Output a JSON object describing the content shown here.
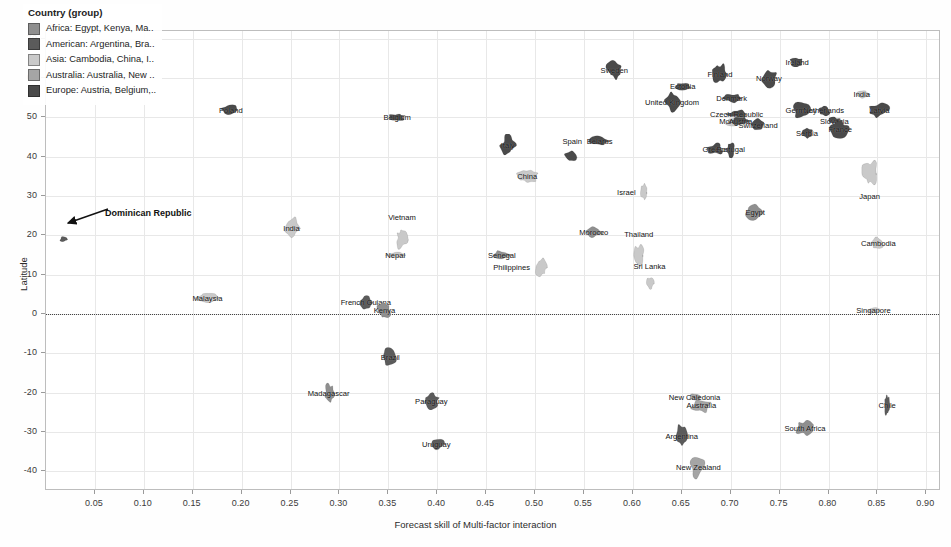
{
  "chart_data": {
    "type": "scatter",
    "title": "",
    "xlabel": "Forecast skill of Multi-factor interaction",
    "ylabel": "Latitude",
    "xlim": [
      0.0,
      0.915
    ],
    "ylim": [
      -45,
      72
    ],
    "xticks": [
      "0.05",
      "0.10",
      "0.15",
      "0.20",
      "0.25",
      "0.30",
      "0.35",
      "0.40",
      "0.45",
      "0.50",
      "0.55",
      "0.60",
      "0.65",
      "0.70",
      "0.75",
      "0.80",
      "0.85",
      "0.90"
    ],
    "xtick_values": [
      0.05,
      0.1,
      0.15,
      0.2,
      0.25,
      0.3,
      0.35,
      0.4,
      0.45,
      0.5,
      0.55,
      0.6,
      0.65,
      0.7,
      0.75,
      0.8,
      0.85,
      0.9
    ],
    "yticks": [
      "70",
      "60",
      "50",
      "40",
      "30",
      "20",
      "10",
      "0",
      "-10",
      "-20",
      "-30",
      "-40"
    ],
    "ytick_values": [
      70,
      60,
      50,
      40,
      30,
      20,
      10,
      0,
      -10,
      -20,
      -30,
      -40
    ],
    "grid": true,
    "zero_reference_line": 0,
    "legend_position": "top-left",
    "marker_style": "country-silhouette",
    "points": [
      {
        "label": "Dominican Republic",
        "x": 0.018,
        "y": 19,
        "group": "American",
        "lpos": "none",
        "w": 11,
        "h": 6
      },
      {
        "label": "Malaysia",
        "x": 0.165,
        "y": 4,
        "group": "Asia",
        "lpos": "center",
        "w": 30,
        "h": 11
      },
      {
        "label": "Poland",
        "x": 0.189,
        "y": 52,
        "group": "Europe",
        "lpos": "center",
        "w": 26,
        "h": 12
      },
      {
        "label": "India",
        "x": 0.251,
        "y": 22,
        "group": "Asia",
        "lpos": "center",
        "w": 18,
        "h": 26
      },
      {
        "label": "Madagascar",
        "x": 0.289,
        "y": -20,
        "group": "Africa",
        "lpos": "center",
        "w": 12,
        "h": 24
      },
      {
        "label": "French Guiana",
        "x": 0.327,
        "y": 3,
        "group": "American",
        "lpos": "center",
        "w": 14,
        "h": 16
      },
      {
        "label": "Kenya",
        "x": 0.346,
        "y": 1,
        "group": "Africa",
        "lpos": "center",
        "w": 18,
        "h": 18
      },
      {
        "label": "Brazil",
        "x": 0.352,
        "y": -11,
        "group": "American",
        "lpos": "center",
        "w": 24,
        "h": 26
      },
      {
        "label": "Nepal",
        "x": 0.357,
        "y": 15,
        "group": "Asia",
        "lpos": "center",
        "w": 22,
        "h": 8
      },
      {
        "label": "Belgium",
        "x": 0.359,
        "y": 50,
        "group": "Europe",
        "lpos": "center",
        "w": 20,
        "h": 8
      },
      {
        "label": "Vietnam",
        "x": 0.364,
        "y": 19,
        "group": "Asia",
        "lpos": "above",
        "w": 13,
        "h": 26
      },
      {
        "label": "Paraguay",
        "x": 0.394,
        "y": -22,
        "group": "American",
        "lpos": "center",
        "w": 20,
        "h": 18
      },
      {
        "label": "Uruguay",
        "x": 0.399,
        "y": -33,
        "group": "American",
        "lpos": "center",
        "w": 18,
        "h": 16
      },
      {
        "label": "Senegal",
        "x": 0.466,
        "y": 15,
        "group": "Africa",
        "lpos": "center",
        "w": 20,
        "h": 12
      },
      {
        "label": "Italy",
        "x": 0.472,
        "y": 43,
        "group": "Europe",
        "lpos": "center",
        "w": 18,
        "h": 22
      },
      {
        "label": "China",
        "x": 0.492,
        "y": 35,
        "group": "Asia",
        "lpos": "center",
        "w": 26,
        "h": 16
      },
      {
        "label": "Philippines",
        "x": 0.506,
        "y": 12,
        "group": "Asia",
        "lpos": "left",
        "w": 14,
        "h": 22
      },
      {
        "label": "Spain",
        "x": 0.538,
        "y": 40,
        "group": "Europe",
        "lpos": "above",
        "w": 20,
        "h": 14
      },
      {
        "label": "Morocco",
        "x": 0.56,
        "y": 21,
        "group": "Africa",
        "lpos": "center",
        "w": 22,
        "h": 12
      },
      {
        "label": "Belarus",
        "x": 0.566,
        "y": 44,
        "group": "Europe",
        "lpos": "center",
        "w": 24,
        "h": 12
      },
      {
        "label": "Sweden",
        "x": 0.581,
        "y": 62,
        "group": "Europe",
        "lpos": "center",
        "w": 18,
        "h": 22
      },
      {
        "label": "Thailand",
        "x": 0.606,
        "y": 15,
        "group": "Asia",
        "lpos": "above",
        "w": 12,
        "h": 24
      },
      {
        "label": "Israel",
        "x": 0.611,
        "y": 31,
        "group": "Asia",
        "lpos": "left",
        "w": 8,
        "h": 22
      },
      {
        "label": "Sri Lanka",
        "x": 0.617,
        "y": 8,
        "group": "Asia",
        "lpos": "above",
        "w": 10,
        "h": 16
      },
      {
        "label": "United Kingdom",
        "x": 0.64,
        "y": 54,
        "group": "Europe",
        "lpos": "center",
        "w": 18,
        "h": 22
      },
      {
        "label": "Argentina",
        "x": 0.65,
        "y": -31,
        "group": "American",
        "lpos": "center",
        "w": 16,
        "h": 30
      },
      {
        "label": "Estonia",
        "x": 0.651,
        "y": 58,
        "group": "Europe",
        "lpos": "center",
        "w": 20,
        "h": 9
      },
      {
        "label": "New Caledonia",
        "x": 0.663,
        "y": -21,
        "group": "Australia",
        "lpos": "center",
        "w": 18,
        "h": 10
      },
      {
        "label": "New Zealand",
        "x": 0.667,
        "y": -39,
        "group": "Australia",
        "lpos": "center",
        "w": 18,
        "h": 26
      },
      {
        "label": "Australia",
        "x": 0.67,
        "y": -23,
        "group": "Australia",
        "lpos": "center",
        "w": 26,
        "h": 18
      },
      {
        "label": "Greece",
        "x": 0.684,
        "y": 42,
        "group": "Europe",
        "lpos": "center",
        "w": 20,
        "h": 14
      },
      {
        "label": "Finland",
        "x": 0.689,
        "y": 61,
        "group": "Europe",
        "lpos": "center",
        "w": 18,
        "h": 24
      },
      {
        "label": "Portugal",
        "x": 0.7,
        "y": 42,
        "group": "Europe",
        "lpos": "center",
        "w": 10,
        "h": 18
      },
      {
        "label": "Denmark",
        "x": 0.701,
        "y": 55,
        "group": "Europe",
        "lpos": "center",
        "w": 24,
        "h": 12
      },
      {
        "label": "Mongolia",
        "x": 0.704,
        "y": 49,
        "group": "Asia",
        "lpos": "center",
        "w": 26,
        "h": 11
      },
      {
        "label": "Czech Republic",
        "x": 0.706,
        "y": 51,
        "group": "Europe",
        "lpos": "center",
        "w": 24,
        "h": 10
      },
      {
        "label": "Austria",
        "x": 0.71,
        "y": 49,
        "group": "Europe",
        "lpos": "center",
        "w": 22,
        "h": 9
      },
      {
        "label": "Egypt",
        "x": 0.725,
        "y": 26,
        "group": "Africa",
        "lpos": "center",
        "w": 22,
        "h": 18
      },
      {
        "label": "Switzerland",
        "x": 0.728,
        "y": 48,
        "group": "Europe",
        "lpos": "center",
        "w": 20,
        "h": 14
      },
      {
        "label": "Norway",
        "x": 0.739,
        "y": 60,
        "group": "Europe",
        "lpos": "center",
        "w": 20,
        "h": 22
      },
      {
        "label": "Ireland",
        "x": 0.768,
        "y": 64,
        "group": "Europe",
        "lpos": "center",
        "w": 16,
        "h": 10
      },
      {
        "label": "Germany",
        "x": 0.772,
        "y": 52,
        "group": "Europe",
        "lpos": "center",
        "w": 20,
        "h": 22
      },
      {
        "label": "South Africa",
        "x": 0.776,
        "y": -29,
        "group": "Africa",
        "lpos": "center",
        "w": 22,
        "h": 16
      },
      {
        "label": "Serbia",
        "x": 0.778,
        "y": 46,
        "group": "Europe",
        "lpos": "center",
        "w": 14,
        "h": 14
      },
      {
        "label": "Netherlands",
        "x": 0.795,
        "y": 52,
        "group": "Europe",
        "lpos": "center",
        "w": 16,
        "h": 14
      },
      {
        "label": "Slovakia",
        "x": 0.806,
        "y": 49,
        "group": "Europe",
        "lpos": "center",
        "w": 20,
        "h": 9
      },
      {
        "label": "France",
        "x": 0.812,
        "y": 47,
        "group": "Europe",
        "lpos": "center",
        "w": 22,
        "h": 20
      },
      {
        "label": "India",
        "x": 0.834,
        "y": 56,
        "group": "Asia",
        "lpos": "center",
        "w": 18,
        "h": 10
      },
      {
        "label": "Cambodia",
        "x": 0.851,
        "y": 18,
        "group": "Asia",
        "lpos": "center",
        "w": 18,
        "h": 14
      },
      {
        "label": "Singapore",
        "x": 0.846,
        "y": 1,
        "group": "Asia",
        "lpos": "center",
        "w": 18,
        "h": 7
      },
      {
        "label": "Latvia",
        "x": 0.852,
        "y": 52,
        "group": "Europe",
        "lpos": "center",
        "w": 24,
        "h": 18
      },
      {
        "label": "Japan",
        "x": 0.842,
        "y": 36,
        "group": "Asia",
        "lpos": "below",
        "w": 18,
        "h": 30
      },
      {
        "label": "Chile",
        "x": 0.86,
        "y": -23,
        "group": "American",
        "lpos": "center",
        "w": 6,
        "h": 26
      }
    ]
  },
  "legend": {
    "title": "Country (group)",
    "items": [
      {
        "label": "Africa: Egypt, Kenya, Ma..",
        "color": "#8f8f8f",
        "group": "Africa"
      },
      {
        "label": "American: Argentina, Bra..",
        "color": "#5b5b5b",
        "group": "American"
      },
      {
        "label": "Asia: Cambodia, China, I..",
        "color": "#c9c9c9",
        "group": "Asia"
      },
      {
        "label": "Australia: Australia, New ..",
        "color": "#a5a5a5",
        "group": "Australia"
      },
      {
        "label": "Europe: Austria, Belgium,..",
        "color": "#4a4a4a",
        "group": "Europe"
      }
    ]
  },
  "annotations": [
    {
      "name": "dominican-republic-callout",
      "text": "Dominican Republic"
    }
  ],
  "axes": {
    "x_title": "Forecast skill of Multi-factor interaction",
    "y_title": "Latitude"
  },
  "colors": {
    "africa": "#8f8f8f",
    "american": "#5b5b5b",
    "asia": "#c9c9c9",
    "australia": "#a5a5a5",
    "europe": "#4a4a4a",
    "grid": "#e8e8e8",
    "frame": "#bdbdbd",
    "text": "#222222"
  }
}
